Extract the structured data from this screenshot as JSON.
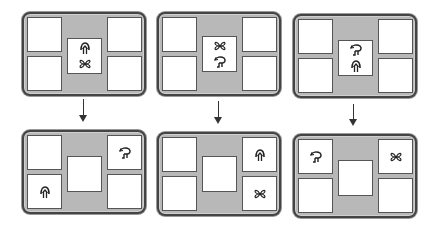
{
  "diagram": {
    "colors": {
      "panel_fill": "#b8b8b8",
      "border": "#444444",
      "cell_fill": "#ffffff",
      "arrow": "#333333"
    },
    "glyphs": {
      "arrow-up-icon": "upward arrow glyph (curved arch with stem)",
      "four-petal-icon": "four-petal / X-shaped flower glyph",
      "hook-arrow-icon": "curved hook / turning-arrow glyph"
    },
    "columns": [
      {
        "id": "column-1",
        "before": {
          "center": [
            "arrow-up-icon",
            "four-petal-icon"
          ],
          "top_left": "",
          "bottom_left": "",
          "top_right": "",
          "bottom_right": ""
        },
        "after": {
          "center": [],
          "top_left": "",
          "bottom_left": "arrow-up-icon",
          "top_right": "hook-arrow-icon",
          "bottom_right": ""
        }
      },
      {
        "id": "column-2",
        "before": {
          "center": [
            "four-petal-icon",
            "hook-arrow-icon"
          ],
          "top_left": "",
          "bottom_left": "",
          "top_right": "",
          "bottom_right": ""
        },
        "after": {
          "center": [],
          "top_left": "",
          "bottom_left": "",
          "top_right": "arrow-up-icon",
          "bottom_right": "four-petal-icon"
        }
      },
      {
        "id": "column-3",
        "before": {
          "center": [
            "hook-arrow-icon",
            "arrow-up-icon"
          ],
          "top_left": "",
          "bottom_left": "",
          "top_right": "",
          "bottom_right": ""
        },
        "after": {
          "center": [],
          "top_left": "hook-arrow-icon",
          "bottom_left": "",
          "top_right": "four-petal-icon",
          "bottom_right": ""
        }
      }
    ]
  }
}
